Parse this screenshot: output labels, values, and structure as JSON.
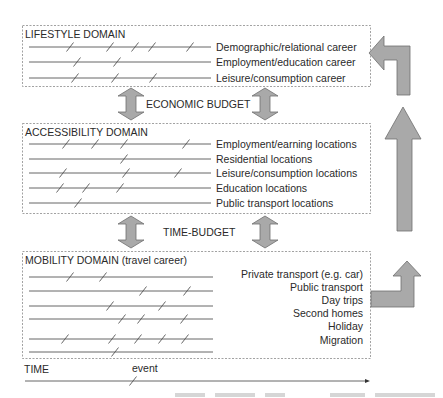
{
  "diagram": {
    "domains": [
      {
        "title": "LIFESTYLE DOMAIN",
        "box": {
          "x": 22,
          "y": 25,
          "w": 348,
          "h": 61
        },
        "label_align": "left",
        "rows": [
          {
            "label": "Demographic/relational career",
            "y": 47,
            "events": [
              70,
              110,
              135,
              152,
              190
            ]
          },
          {
            "label": "Employment/education career",
            "y": 62,
            "events": [
              77,
              117
            ]
          },
          {
            "label": "Leisure/consumption career",
            "y": 78,
            "events": [
              75,
              115,
              153
            ]
          }
        ]
      },
      {
        "title": "ACCESSIBILITY DOMAIN",
        "box": {
          "x": 22,
          "y": 123,
          "w": 348,
          "h": 90
        },
        "label_align": "left",
        "rows": [
          {
            "label": "Employment/earning locations",
            "y": 144,
            "events": [
              66,
              95,
              124,
              186
            ]
          },
          {
            "label": "Residential locations",
            "y": 159,
            "events": [
              124
            ]
          },
          {
            "label": "Leisure/consumption locations",
            "y": 173,
            "events": [
              63,
              126,
              178
            ]
          },
          {
            "label": "Education locations",
            "y": 188,
            "events": [
              60,
              86,
              120
            ]
          },
          {
            "label": "Public transport locations",
            "y": 203,
            "events": [
              78
            ]
          }
        ]
      },
      {
        "title": "MOBILITY DOMAIN (travel career)",
        "box": {
          "x": 22,
          "y": 251,
          "w": 348,
          "h": 107
        },
        "label_align": "right",
        "rows": [
          {
            "label": "Private transport (e.g. car)",
            "y": 277,
            "events": [
              70,
              103
            ]
          },
          {
            "label": "Public transport",
            "y": 291,
            "events": [
              143,
              187
            ]
          },
          {
            "label": "Day trips",
            "y": 306,
            "events": [
              110,
              162
            ]
          },
          {
            "label": "Second homes",
            "y": 319,
            "events": [
              122,
              141,
              184
            ]
          },
          {
            "label": "Holiday",
            "y": 339,
            "events": [
              65,
              112,
              138,
              162,
              185
            ]
          },
          {
            "label": "Migration",
            "y": 352,
            "events": [
              115
            ]
          }
        ]
      }
    ],
    "budgets": [
      {
        "label": "ECONOMIC BUDGET",
        "y_top": 88,
        "y_bottom": 120,
        "arrows_x": [
          131,
          265
        ]
      },
      {
        "label": "TIME-BUDGET",
        "y_top": 216,
        "y_bottom": 248,
        "arrows_x": [
          131,
          265
        ]
      }
    ],
    "time_axis": {
      "label": "TIME",
      "event_label": "event",
      "y": 381,
      "x_start": 25,
      "x_end": 370,
      "event_x": 133
    },
    "colors": {
      "arrow_fill": "#a9a9a9",
      "arrow_stroke": "#6e6e6e",
      "line": "#555555",
      "box_border": "#8a8a8a",
      "text": "#2a2a2a"
    }
  }
}
